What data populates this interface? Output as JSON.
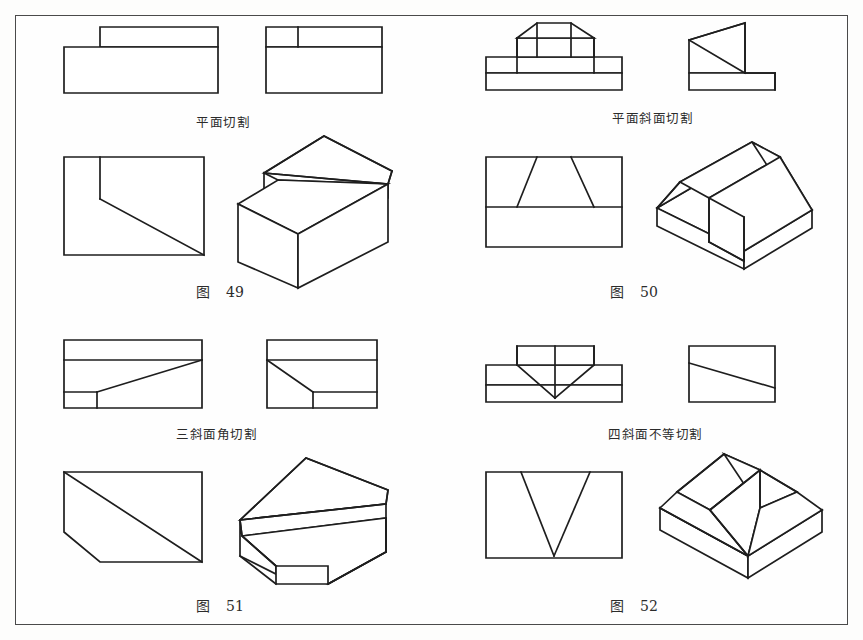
{
  "page": {
    "kind": "technical-drawing-plate",
    "border_color": "#4a4a4a",
    "line_color": "#1e1e1e",
    "background_color": "#fefefe"
  },
  "figures": [
    {
      "id": "fig-49",
      "label_prefix": "图",
      "label_number": "49",
      "caption": "平面切割",
      "caption_pinyin_meaning": "plane cut",
      "views": [
        "front-view",
        "top-view",
        "side-view",
        "isometric-view"
      ]
    },
    {
      "id": "fig-50",
      "label_prefix": "图",
      "label_number": "50",
      "caption": "平面斜面切割",
      "caption_pinyin_meaning": "plane and inclined plane cut",
      "views": [
        "front-view",
        "top-view",
        "side-view",
        "isometric-view"
      ]
    },
    {
      "id": "fig-51",
      "label_prefix": "图",
      "label_number": "51",
      "caption": "三斜面角切割",
      "caption_pinyin_meaning": "three inclined plane corner cut",
      "views": [
        "front-view",
        "top-view",
        "side-view",
        "isometric-view"
      ]
    },
    {
      "id": "fig-52",
      "label_prefix": "图",
      "label_number": "52",
      "caption": "四斜面不等切割",
      "caption_pinyin_meaning": "four inclined planes unequal cut",
      "views": [
        "front-view",
        "top-view",
        "side-view",
        "isometric-view"
      ]
    }
  ]
}
